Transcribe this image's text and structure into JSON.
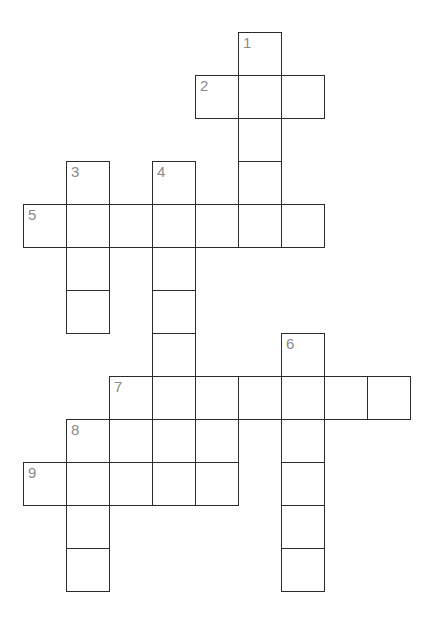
{
  "puzzle": {
    "type": "crossword-grid",
    "title": "Crossword puzzle grid",
    "geometry": {
      "origin_x": 23,
      "origin_y": 32,
      "cell_size": 43,
      "border_color": "#2b2b2b",
      "cell_fill": "#ffffff",
      "number_color": "#8a8a8a",
      "page_background": "#ffffff"
    },
    "numbers": [
      "1",
      "2",
      "3",
      "4",
      "5",
      "6",
      "7",
      "8",
      "9"
    ],
    "entries": [
      {
        "number": "1",
        "direction": "down",
        "col": 5,
        "row": 0,
        "length": 5
      },
      {
        "number": "2",
        "direction": "across",
        "col": 4,
        "row": 1,
        "length": 3
      },
      {
        "number": "3",
        "direction": "down",
        "col": 1,
        "row": 3,
        "length": 4
      },
      {
        "number": "4",
        "direction": "down",
        "col": 3,
        "row": 3,
        "length": 8
      },
      {
        "number": "5",
        "direction": "across",
        "col": 0,
        "row": 4,
        "length": 7
      },
      {
        "number": "6",
        "direction": "down",
        "col": 6,
        "row": 7,
        "length": 6
      },
      {
        "number": "7",
        "direction": "across",
        "col": 2,
        "row": 8,
        "length": 7
      },
      {
        "number": "8",
        "direction": "down",
        "col": 1,
        "row": 9,
        "length": 5
      },
      {
        "number": "9",
        "direction": "across",
        "col": 0,
        "row": 10,
        "length": 5
      }
    ],
    "cells": [
      {
        "col": 5,
        "row": 0,
        "number": "1"
      },
      {
        "col": 4,
        "row": 1,
        "number": "2"
      },
      {
        "col": 5,
        "row": 1,
        "number": ""
      },
      {
        "col": 6,
        "row": 1,
        "number": ""
      },
      {
        "col": 5,
        "row": 2,
        "number": ""
      },
      {
        "col": 5,
        "row": 3,
        "number": ""
      },
      {
        "col": 1,
        "row": 3,
        "number": "3"
      },
      {
        "col": 3,
        "row": 3,
        "number": "4"
      },
      {
        "col": 0,
        "row": 4,
        "number": "5"
      },
      {
        "col": 1,
        "row": 4,
        "number": ""
      },
      {
        "col": 2,
        "row": 4,
        "number": ""
      },
      {
        "col": 3,
        "row": 4,
        "number": ""
      },
      {
        "col": 4,
        "row": 4,
        "number": ""
      },
      {
        "col": 5,
        "row": 4,
        "number": ""
      },
      {
        "col": 6,
        "row": 4,
        "number": ""
      },
      {
        "col": 1,
        "row": 5,
        "number": ""
      },
      {
        "col": 3,
        "row": 5,
        "number": ""
      },
      {
        "col": 1,
        "row": 6,
        "number": ""
      },
      {
        "col": 3,
        "row": 6,
        "number": ""
      },
      {
        "col": 3,
        "row": 7,
        "number": ""
      },
      {
        "col": 6,
        "row": 7,
        "number": "6"
      },
      {
        "col": 2,
        "row": 8,
        "number": "7"
      },
      {
        "col": 3,
        "row": 8,
        "number": ""
      },
      {
        "col": 4,
        "row": 8,
        "number": ""
      },
      {
        "col": 5,
        "row": 8,
        "number": ""
      },
      {
        "col": 6,
        "row": 8,
        "number": ""
      },
      {
        "col": 7,
        "row": 8,
        "number": ""
      },
      {
        "col": 8,
        "row": 8,
        "number": ""
      },
      {
        "col": 1,
        "row": 9,
        "number": "8"
      },
      {
        "col": 2,
        "row": 9,
        "number": ""
      },
      {
        "col": 3,
        "row": 9,
        "number": ""
      },
      {
        "col": 4,
        "row": 9,
        "number": ""
      },
      {
        "col": 6,
        "row": 9,
        "number": ""
      },
      {
        "col": 0,
        "row": 10,
        "number": "9"
      },
      {
        "col": 1,
        "row": 10,
        "number": ""
      },
      {
        "col": 2,
        "row": 10,
        "number": ""
      },
      {
        "col": 3,
        "row": 10,
        "number": ""
      },
      {
        "col": 4,
        "row": 10,
        "number": ""
      },
      {
        "col": 6,
        "row": 10,
        "number": ""
      },
      {
        "col": 1,
        "row": 11,
        "number": ""
      },
      {
        "col": 6,
        "row": 11,
        "number": ""
      },
      {
        "col": 1,
        "row": 12,
        "number": ""
      },
      {
        "col": 6,
        "row": 12,
        "number": ""
      }
    ]
  }
}
